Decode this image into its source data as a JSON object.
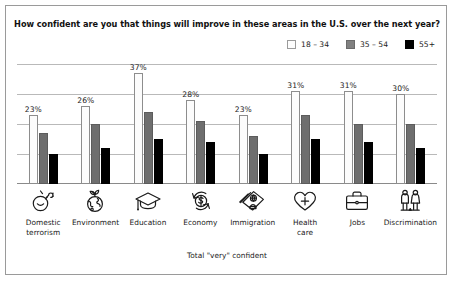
{
  "header": {
    "title": "How confident are you that things will improve in these areas in the U.S. over the next year?"
  },
  "legend": {
    "items": [
      {
        "label": "18 – 34",
        "color": "#fdfdfd",
        "icon": "legend-swatch-18-34"
      },
      {
        "label": "35 – 54",
        "color": "#808080",
        "icon": "legend-swatch-35-54"
      },
      {
        "label": "55+",
        "color": "#000000",
        "icon": "legend-swatch-55-plus"
      }
    ]
  },
  "footer": {
    "note": "Total \"very\" confident"
  },
  "chart_data": {
    "type": "bar",
    "title": "How confident are you that things will improve in these areas in the U.S. over the next year?",
    "xlabel": "",
    "ylabel": "",
    "ylim": [
      0,
      40
    ],
    "grid": true,
    "gridlines": [
      10,
      20,
      30,
      40
    ],
    "legend_position": "top-right",
    "categories": [
      "Domestic\nterrorism",
      "Environment",
      "Education",
      "Economy",
      "Immigration",
      "Health\ncare",
      "Jobs",
      "Discrimination"
    ],
    "category_icons": [
      "bomb-icon",
      "globe-plant-icon",
      "graduation-cap-icon",
      "dollar-recycle-icon",
      "passport-id-icon",
      "heart-cross-icon",
      "briefcase-icon",
      "two-people-icon"
    ],
    "series": [
      {
        "name": "18 – 34",
        "color": "#fdfdfd",
        "values": [
          23,
          26,
          37,
          28,
          23,
          31,
          31,
          30
        ]
      },
      {
        "name": "35 – 54",
        "color": "#808080",
        "values": [
          17,
          20,
          24,
          21,
          16,
          23,
          20,
          20
        ]
      },
      {
        "name": "55+",
        "color": "#000000",
        "values": [
          10,
          12,
          15,
          14,
          10,
          15,
          14,
          12
        ]
      }
    ],
    "data_labels": [
      "23%",
      "26%",
      "37%",
      "28%",
      "23%",
      "31%",
      "31%",
      "30%"
    ]
  }
}
